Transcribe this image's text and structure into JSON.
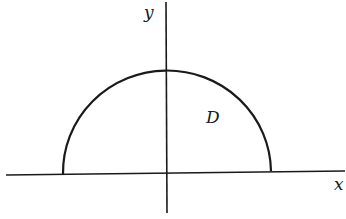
{
  "diagram": {
    "labels": {
      "x_axis": "x",
      "y_axis": "y",
      "region": "D"
    },
    "shape": "semicircle",
    "colors": {
      "stroke": "#1a1a1a",
      "background": "#ffffff"
    }
  }
}
